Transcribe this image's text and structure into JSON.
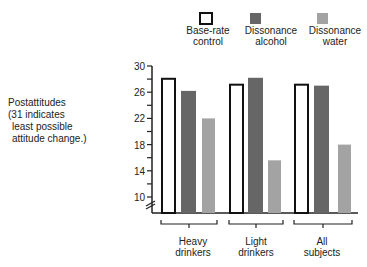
{
  "chart_data": {
    "type": "bar",
    "title": "",
    "xlabel": "",
    "ylabel": "Postattitudes (31 indicates least possible attitude change.)",
    "ylim": [
      10,
      30
    ],
    "yticks": [
      10,
      14,
      18,
      22,
      26,
      30
    ],
    "categories": [
      "Heavy drinkers",
      "Light drinkers",
      "All subjects"
    ],
    "series": [
      {
        "name": "Base-rate control",
        "values": [
          28.2,
          27.3,
          27.3
        ],
        "color": "#ffffff",
        "stroke": "#111111"
      },
      {
        "name": "Dissonance alcohol",
        "values": [
          26.2,
          28.2,
          27.0
        ],
        "color": "#666666"
      },
      {
        "name": "Dissonance water",
        "values": [
          22.0,
          15.6,
          18.0
        ],
        "color": "#a3a3a3"
      }
    ],
    "legend_position": "top",
    "grid": false,
    "axis_break": true
  },
  "ylabel_lines": [
    "Postattitudes",
    "(31 indicates",
    " least possible",
    " attitude change.)"
  ],
  "legend": [
    {
      "line1": "Base-rate",
      "line2": "control"
    },
    {
      "line1": "Dissonance",
      "line2": "alcohol"
    },
    {
      "line1": "Dissonance",
      "line2": "water"
    }
  ],
  "categories": [
    {
      "line1": "Heavy",
      "line2": "drinkers"
    },
    {
      "line1": "Light",
      "line2": "drinkers"
    },
    {
      "line1": "All",
      "line2": "subjects"
    }
  ],
  "ticks": [
    "30",
    "26",
    "22",
    "18",
    "14",
    "10"
  ]
}
